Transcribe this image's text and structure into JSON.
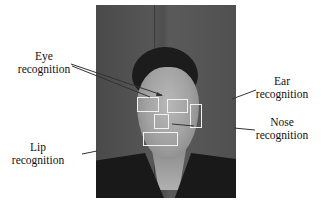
{
  "figure": {
    "type": "face-feature-recognition-diagram",
    "photo": {
      "description": "grayscale portrait photo of a person facing the camera"
    },
    "labels": {
      "eye": {
        "line1": "Eye",
        "line2": "recognition"
      },
      "ear": {
        "line1": "Ear",
        "line2": "recognition"
      },
      "nose": {
        "line1": "Nose",
        "line2": "recognition"
      },
      "lip": {
        "line1": "Lip",
        "line2": "recognition"
      }
    },
    "boxes": [
      {
        "name": "left-eye",
        "color": "#f2f2f2"
      },
      {
        "name": "right-eye",
        "color": "#f2f2f2"
      },
      {
        "name": "ear",
        "color": "#f2f2f2"
      },
      {
        "name": "nose",
        "color": "#f2f2f2"
      },
      {
        "name": "lip",
        "color": "#f2f2f2"
      }
    ],
    "colors": {
      "box_stroke": "#f2f2f2",
      "leader_line": "#333333",
      "text": "#111111"
    }
  }
}
